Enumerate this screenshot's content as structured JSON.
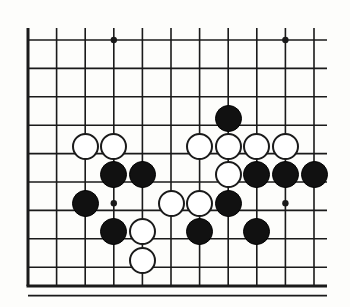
{
  "board": {
    "title": "Go board position diagram",
    "background_color": "#fdfdfb",
    "line_color": "#1a1a1a",
    "black_stone_color": "#111111",
    "white_stone_color": "#ffffff",
    "grid": {
      "columns": 11,
      "rows": 10,
      "origin_x": 28,
      "origin_y": 40,
      "col_spacing": 28.6,
      "row_spacing": 28.4,
      "stone_diameter": 27,
      "edge_line_width": 3,
      "inner_line_width": 1.6,
      "edges": {
        "left": true,
        "top": false,
        "right": false,
        "bottom": true
      },
      "left_edge_x": 28,
      "bottom_edge_y": 286,
      "line_right_extent": 327,
      "line_top_extent": 28
    },
    "star_points": [
      {
        "col": 3,
        "row": 0
      },
      {
        "col": 9,
        "row": 0
      },
      {
        "col": 3,
        "row": 5.75
      },
      {
        "col": 9,
        "row": 5.75
      }
    ],
    "star_point_radius": 3.2,
    "stones": [
      {
        "color": "black",
        "col": 7,
        "row": 2.75
      },
      {
        "color": "white",
        "col": 2,
        "row": 3.75
      },
      {
        "color": "white",
        "col": 3,
        "row": 3.75
      },
      {
        "color": "white",
        "col": 6,
        "row": 3.75
      },
      {
        "color": "white",
        "col": 7,
        "row": 3.75
      },
      {
        "color": "white",
        "col": 8,
        "row": 3.75
      },
      {
        "color": "white",
        "col": 9,
        "row": 3.75
      },
      {
        "color": "black",
        "col": 3,
        "row": 4.75
      },
      {
        "color": "black",
        "col": 4,
        "row": 4.75
      },
      {
        "color": "white",
        "col": 7,
        "row": 4.75
      },
      {
        "color": "black",
        "col": 8,
        "row": 4.75
      },
      {
        "color": "black",
        "col": 9,
        "row": 4.75
      },
      {
        "color": "black",
        "col": 10,
        "row": 4.75
      },
      {
        "color": "black",
        "col": 2,
        "row": 5.75
      },
      {
        "color": "white",
        "col": 5,
        "row": 5.75
      },
      {
        "color": "white",
        "col": 6,
        "row": 5.75
      },
      {
        "color": "black",
        "col": 7,
        "row": 5.75
      },
      {
        "color": "black",
        "col": 3,
        "row": 6.75
      },
      {
        "color": "white",
        "col": 4,
        "row": 6.75
      },
      {
        "color": "black",
        "col": 6,
        "row": 6.75
      },
      {
        "color": "black",
        "col": 8,
        "row": 6.75
      },
      {
        "color": "white",
        "col": 4,
        "row": 7.75
      }
    ]
  }
}
